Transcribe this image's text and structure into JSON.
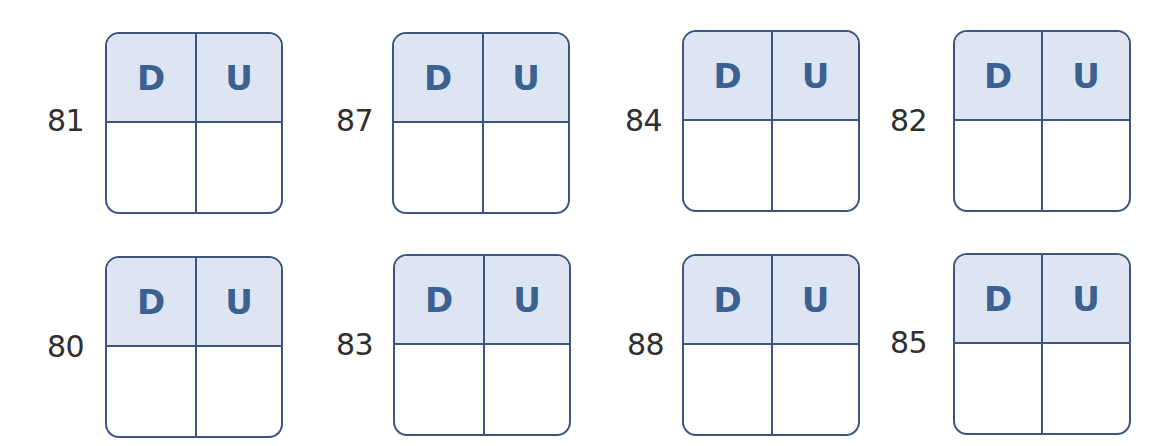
{
  "worksheet": {
    "column_headers": {
      "tens": "D",
      "units": "U"
    },
    "colors": {
      "border": "#3c5680",
      "header_fill": "#dce5f1",
      "header_text": "#3b6092",
      "number_text": "#2f2f2f"
    },
    "rows": [
      {
        "items": [
          {
            "number": "81",
            "tens_answer": "",
            "units_answer": ""
          },
          {
            "number": "87",
            "tens_answer": "",
            "units_answer": ""
          },
          {
            "number": "84",
            "tens_answer": "",
            "units_answer": ""
          },
          {
            "number": "82",
            "tens_answer": "",
            "units_answer": ""
          }
        ]
      },
      {
        "items": [
          {
            "number": "80",
            "tens_answer": "",
            "units_answer": ""
          },
          {
            "number": "83",
            "tens_answer": "",
            "units_answer": ""
          },
          {
            "number": "88",
            "tens_answer": "",
            "units_answer": ""
          },
          {
            "number": "85",
            "tens_answer": "",
            "units_answer": ""
          }
        ]
      }
    ]
  }
}
